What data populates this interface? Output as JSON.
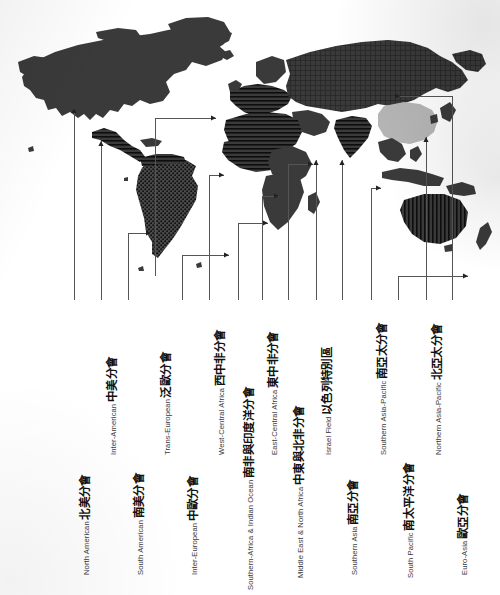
{
  "figure": {
    "type": "world-map-diagram",
    "background_color": "#ffffff",
    "land_color": "#3a3a3a",
    "highlight_color": "#b6b6b6",
    "leader_line_color": "#555555"
  },
  "labels": [
    {
      "id": "north-american",
      "zh": "北美分會",
      "en": "North American",
      "label_x": 74,
      "label_y": 575,
      "line_x": 74,
      "line_top": 300,
      "anchor_x": 74,
      "anchor_y": 108,
      "elbow": null
    },
    {
      "id": "inter-american",
      "zh": "中美分會",
      "en": "Inter-American",
      "label_x": 101,
      "label_y": 455,
      "line_x": 101,
      "line_top": 300,
      "anchor_x": 101,
      "anchor_y": 141,
      "elbow": null
    },
    {
      "id": "south-american",
      "zh": "南美分會",
      "en": "South American",
      "label_x": 128,
      "label_y": 575,
      "line_x": 128,
      "line_top": 300,
      "anchor_x": 151,
      "anchor_y": 233,
      "elbow": 233
    },
    {
      "id": "trans-european",
      "zh": "泛歐分會",
      "en": "Trans-European",
      "label_x": 155,
      "label_y": 455,
      "line_x": 155,
      "line_top": 276,
      "anchor_x": 216,
      "anchor_y": 118,
      "elbow": 118
    },
    {
      "id": "inter-european",
      "zh": "中歐分會",
      "en": "Inter-European",
      "label_x": 182,
      "label_y": 575,
      "line_x": 182,
      "line_top": 300,
      "anchor_x": 229,
      "anchor_y": 255,
      "elbow": 255
    },
    {
      "id": "west-central-africa",
      "zh": "西中非分會",
      "en": "West-Central Africa",
      "label_x": 209,
      "label_y": 455,
      "line_x": 209,
      "line_top": 300,
      "anchor_x": 224,
      "anchor_y": 175,
      "elbow": 175
    },
    {
      "id": "southern-africa-indian-ocean",
      "zh": "南非與印度洋分會",
      "en": "Southern-Africa & Indian Ocean",
      "label_x": 238,
      "label_y": 590,
      "line_x": 238,
      "line_top": 300,
      "anchor_x": 268,
      "anchor_y": 223,
      "elbow": 223
    },
    {
      "id": "east-central-africa",
      "zh": "東中非分會",
      "en": "East-Central Africa",
      "label_x": 262,
      "label_y": 455,
      "line_x": 262,
      "line_top": 300,
      "anchor_x": 279,
      "anchor_y": 196,
      "elbow": 196
    },
    {
      "id": "middle-east-north-africa",
      "zh": "中東與北非分會",
      "en": "Middle East & North Africa",
      "label_x": 288,
      "label_y": 578,
      "line_x": 288,
      "line_top": 300,
      "anchor_x": 313,
      "anchor_y": 164,
      "elbow": 164
    },
    {
      "id": "israel-field",
      "zh": "以色列特別區",
      "en": "Israel Field",
      "label_x": 316,
      "label_y": 455,
      "line_x": 316,
      "line_top": 300,
      "anchor_x": 316,
      "anchor_y": 160,
      "elbow": null
    },
    {
      "id": "southern-asia",
      "zh": "南亞分會",
      "en": "Southern Asia",
      "label_x": 342,
      "label_y": 575,
      "line_x": 342,
      "line_top": 300,
      "anchor_x": 342,
      "anchor_y": 160,
      "elbow": null
    },
    {
      "id": "southern-asia-pacific",
      "zh": "南亞太分會",
      "en": "Southern Asia-Pacific",
      "label_x": 371,
      "label_y": 455,
      "line_x": 371,
      "line_top": 300,
      "anchor_x": 381,
      "anchor_y": 188,
      "elbow": 188
    },
    {
      "id": "south-pacific",
      "zh": "南太平洋分會",
      "en": "South Pacific",
      "label_x": 398,
      "label_y": 578,
      "line_x": 398,
      "line_top": 300,
      "anchor_x": 468,
      "anchor_y": 276,
      "elbow": 276
    },
    {
      "id": "northern-asia-pacific",
      "zh": "北亞太分會",
      "en": "Northern Asia-Pacific",
      "label_x": 426,
      "label_y": 455,
      "line_x": 426,
      "line_top": 300,
      "anchor_x": 426,
      "anchor_y": 137,
      "elbow": null
    },
    {
      "id": "euro-asia",
      "zh": "歐亞分會",
      "en": "Euro-Asia",
      "label_x": 452,
      "label_y": 575,
      "line_x": 452,
      "line_top": 300,
      "anchor_x": 400,
      "anchor_y": 96,
      "elbow": 96
    }
  ]
}
